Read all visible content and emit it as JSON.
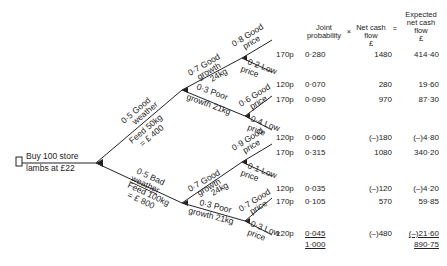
{
  "root": {
    "decision_label_line1": "Buy 100 store",
    "decision_label_line2": "lambs at £22"
  },
  "weather": {
    "good": {
      "prob_label": "0·5 Good",
      "label": "weather",
      "feed_line1": "Feed 50kg",
      "feed_line2": "= £ 400"
    },
    "bad": {
      "prob_label": "0·5 Bad",
      "label": "weather",
      "feed_line1": "Feed 100kg",
      "feed_line2": "= £ 800"
    }
  },
  "growth": {
    "gw_good": {
      "line1": "0·7 Good",
      "line2": "growth",
      "line3": "24kg"
    },
    "gw_poor": {
      "line1": "0·3 Poor",
      "line2": "growth 21kg"
    },
    "bw_good": {
      "line1": "0·7 Good",
      "line2": "growth",
      "line3": "24kg"
    },
    "bw_poor": {
      "line1": "0·3 Poor",
      "line2": "growth 21kg"
    }
  },
  "price_branches": [
    {
      "line1": "0·8 Good",
      "line2": "price"
    },
    {
      "line1": "0·2 Low",
      "line2": "price"
    },
    {
      "line1": "0·6 Good",
      "line2": "price"
    },
    {
      "line1": "0·4 Low",
      "line2": "price"
    },
    {
      "line1": "0·9 Good",
      "line2": "price"
    },
    {
      "line1": "0·1 Low",
      "line2": "price"
    },
    {
      "line1": "0·7 Good",
      "line2": "price"
    },
    {
      "line1": "0·3 Low",
      "line2": "price"
    }
  ],
  "table": {
    "headers": {
      "joint_line1": "Joint",
      "joint_line2": "probability",
      "times": "×",
      "cash_line1": "Net cash",
      "cash_line2": "flow",
      "cash_unit": "£",
      "equals": "=",
      "exp_line1": "Expected",
      "exp_line2": "net cash",
      "exp_line3": "flow",
      "exp_unit": "£"
    },
    "rows": [
      {
        "price": "170p",
        "joint_probability": "0·280",
        "net_cash_flow": "1480",
        "expected": "414·40"
      },
      {
        "price": "120p",
        "joint_probability": "0·070",
        "net_cash_flow": "280",
        "expected": "19·60"
      },
      {
        "price": "170p",
        "joint_probability": "0·090",
        "net_cash_flow": "970",
        "expected": "87·30"
      },
      {
        "price": "120p",
        "joint_probability": "0·060",
        "net_cash_flow": "(–)180",
        "expected": "(–)4·80"
      },
      {
        "price": "170p",
        "joint_probability": "0·315",
        "net_cash_flow": "1080",
        "expected": "340·20"
      },
      {
        "price": "120p",
        "joint_probability": "0·035",
        "net_cash_flow": "(–)120",
        "expected": "(–)4·20"
      },
      {
        "price": "170p",
        "joint_probability": "0·105",
        "net_cash_flow": "570",
        "expected": "59·85"
      },
      {
        "price": "120p",
        "joint_probability": "0·045",
        "net_cash_flow": "(–)480",
        "expected": "(–)21·60"
      }
    ],
    "totals": {
      "joint_probability": "1·000",
      "expected": "890·75"
    }
  }
}
